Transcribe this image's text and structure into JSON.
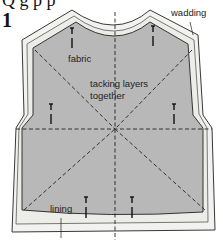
{
  "figure": {
    "heading_fragment": "Q g p p",
    "step_number": "1",
    "labels": {
      "wadding": "wadding",
      "fabric": "fabric",
      "tacking": "tacking layers",
      "tacking_line2": "together",
      "lining": "lining"
    },
    "colors": {
      "fabric_fill": "#b8b8b8",
      "wadding_fill": "#f2f2f0",
      "outline": "#222222"
    }
  }
}
